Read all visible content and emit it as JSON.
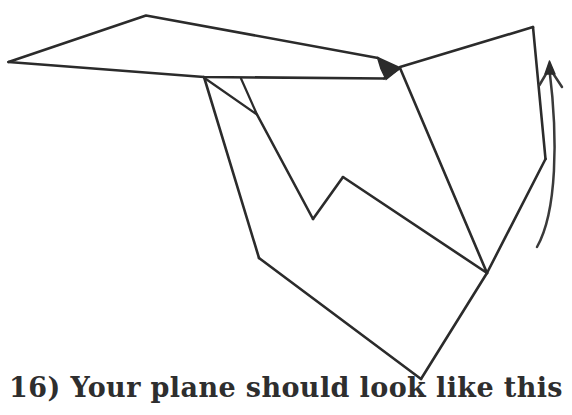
{
  "page": {
    "background_color": "#ffffff",
    "ink_color": "#2b2b2b",
    "width": 572,
    "height": 415
  },
  "caption": {
    "step_number": "16)",
    "text": "16) Your plane should look like this",
    "color": "#2e2e2e"
  },
  "illustration": {
    "title": "folded paper airplane",
    "description": "Hand drawn line diagram of a completed paper airplane seen from above and behind, with a curved arrow at the right side.",
    "icons": {
      "arrow": "curved-up-arrow-icon",
      "plane": "paper-plane-icon"
    },
    "strokes": {
      "left_wing_top": "M 8.5 62 L 146 15 L 378 58",
      "left_wing_bottom": "M 8.5 62 L 204 77 L 384 78",
      "wing_tail_edge": "M 384 78 L 400 68",
      "nose_wedge": "M 378 58 L 400 68 L 385 79 L 380 70 Z",
      "fuselage_left_long": "M 204 77 L 259 258",
      "fold_small_triangle": "M 204 78 L 257 114 L 241 78",
      "fold_crease_down": "M 257 114 L 313 219",
      "valley_right_up": "M 313 219 L 343 177",
      "body_right_long": "M 343 177 L 487 273",
      "nose_to_body": "M 400 68 L 487 273",
      "fin_top_edge": "M 400 67 L 533 27",
      "fin_right_edge": "M 533 27 L 545 159",
      "fin_lower_edge": "M 545 159 L 487 273",
      "body_bottom_left": "M 259 258 L 421 379",
      "body_bottom_right": "M 421 379 L 487 273",
      "arrow_curve": "M 537 247 C 556 210 556 140 549 70",
      "arrow_head_left_barb": "M 549 68 L 540 84",
      "arrow_head_right_barb": "M 549 68 L 562 86"
    }
  }
}
